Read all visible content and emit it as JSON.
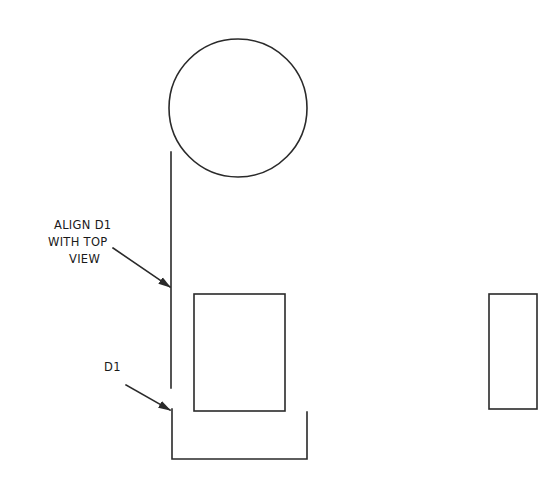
{
  "drawing": {
    "colors": {
      "line": "#2a2a2a",
      "text": "#1a1a1a",
      "background": "#ffffff"
    },
    "annotations": {
      "align_note": {
        "lines": [
          "ALIGN D1",
          "WITH TOP",
          "VIEW"
        ]
      },
      "d1_label": "D1"
    },
    "shapes": {
      "top_view_circle": {
        "cx": 238,
        "cy": 108,
        "r": 69
      },
      "alignment_line": {
        "x": 171,
        "y1": 152,
        "y2": 388
      },
      "front_view_rect": {
        "x": 194,
        "y": 294,
        "w": 91,
        "h": 117
      },
      "bracket_d1": {
        "left_x": 172,
        "right_x": 307,
        "top_left_y": 409,
        "top_right_y": 412,
        "bottom_y": 459
      },
      "side_view_rect": {
        "x": 489,
        "y": 294,
        "w": 48,
        "h": 115
      }
    }
  }
}
